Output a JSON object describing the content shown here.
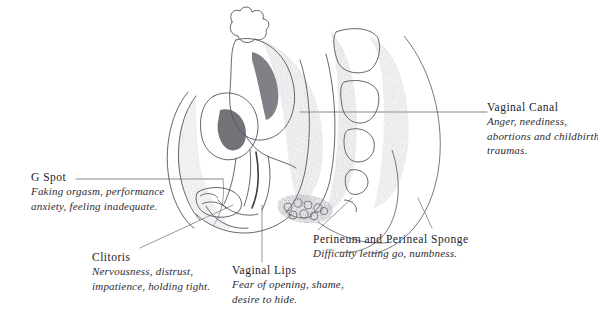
{
  "figure": {
    "kind": "anatomical-illustration",
    "style": "pencil line drawing with stippled shading",
    "background_color": "#ffffff",
    "ink_color": "#3a3a40",
    "text_color": "#25242a"
  },
  "labels": [
    {
      "id": "g-spot",
      "title": "G Spot",
      "desc_lines": [
        "Faking orgasm, performance",
        "anxiety, feeling inadequate."
      ]
    },
    {
      "id": "clitoris",
      "title": "Clitoris",
      "desc_lines": [
        "Nervousness, distrust,",
        "impatience, holding tight."
      ]
    },
    {
      "id": "vaginal-lips",
      "title": "Vaginal Lips",
      "desc_lines": [
        "Fear of opening, shame,",
        "desire to hide."
      ]
    },
    {
      "id": "perineum",
      "title": "Perineum and Perineal Sponge",
      "desc_lines": [
        "Difficulty letting go, numbness."
      ]
    },
    {
      "id": "vaginal-canal",
      "title": "Vaginal Canal",
      "desc_lines": [
        "Anger, neediness,",
        "abortions and childbirth",
        "traumas."
      ]
    }
  ]
}
